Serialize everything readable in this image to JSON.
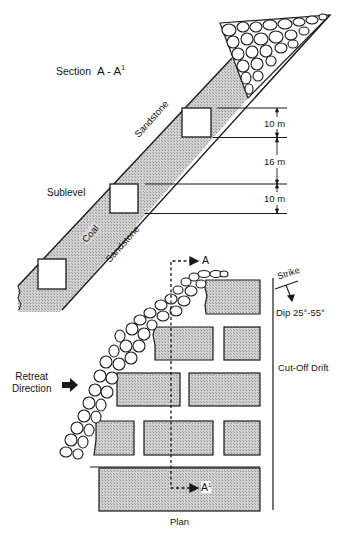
{
  "section": {
    "title": "Section",
    "title_ref": "A - A",
    "title_ref_sup": "1",
    "labels": {
      "sandstone_hanging": "Sandstone",
      "sandstone_foot": "Sandstone",
      "coal": "Coal",
      "sublevel": "Sublevel"
    },
    "dimensions": [
      {
        "label": "10 m"
      },
      {
        "label": "16 m"
      },
      {
        "label": "10 m"
      }
    ]
  },
  "plan": {
    "title": "Plan",
    "section_marker_top": "A",
    "section_marker_bottom": "A",
    "section_marker_bottom_sup": "1",
    "retreat_label_line1": "Retreat",
    "retreat_label_line2": "Direction",
    "strike_label": "Strike",
    "dip_label": "Dip 25°-55°",
    "drift_label": "Cut-Off Drift"
  },
  "colors": {
    "coal_fill": "#bdbdbd",
    "line": "#1a1a1a",
    "background": "#ffffff"
  }
}
